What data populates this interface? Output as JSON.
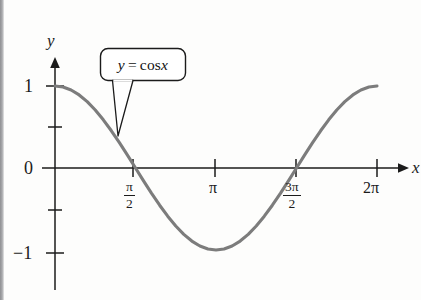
{
  "figure": {
    "kind": "math-function-graph",
    "background_color": "#fdfdfc",
    "curve_color": "#7c7c7c",
    "axis_color": "#1b1b1b",
    "annotation_label": {
      "y_var": "y",
      "equals": "=",
      "expression": "cos",
      "argument": "x",
      "full_text": "y = cos x"
    },
    "axes": {
      "x_axis_label": "x",
      "y_axis_label": "y"
    },
    "origin_label": "0"
  },
  "chart_data": {
    "type": "line",
    "title": "",
    "subtitle": "",
    "xlabel": "x",
    "ylabel": "y",
    "grid": false,
    "legend": null,
    "annotations": [
      {
        "text": "y = cos x",
        "style": "rounded-callout-box",
        "points_to_x": 0.78,
        "points_to_y": 0.71
      }
    ],
    "xlim": [
      0,
      6.7858
    ],
    "ylim": [
      -1.35,
      1.35
    ],
    "xticks": [
      1.5708,
      3.1416,
      4.7124,
      6.2832
    ],
    "xticklabels": [
      "π/2",
      "π",
      "3π/2",
      "2π"
    ],
    "yticks": [
      -1,
      -0.5,
      0,
      0.5,
      1
    ],
    "yticklabels": [
      "-1",
      "",
      "0",
      "",
      "1"
    ],
    "series": [
      {
        "name": "y = cos x",
        "color": "#7c7c7c",
        "x": [
          0,
          0.1571,
          0.3142,
          0.4712,
          0.6283,
          0.7854,
          0.9425,
          1.0996,
          1.2566,
          1.4137,
          1.5708,
          1.7279,
          1.885,
          2.042,
          2.1991,
          2.3562,
          2.5133,
          2.6704,
          2.8274,
          2.9845,
          3.1416,
          3.2987,
          3.4558,
          3.6128,
          3.7699,
          3.927,
          4.0841,
          4.2412,
          4.3982,
          4.5553,
          4.7124,
          4.8695,
          5.0265,
          5.1836,
          5.3407,
          5.4978,
          5.6549,
          5.8119,
          5.969,
          6.1261,
          6.2832
        ],
        "y": [
          1,
          0.9877,
          0.9511,
          0.891,
          0.809,
          0.7071,
          0.5878,
          0.454,
          0.309,
          0.1564,
          0,
          -0.1564,
          -0.309,
          -0.454,
          -0.5878,
          -0.7071,
          -0.809,
          -0.891,
          -0.9511,
          -0.9877,
          -1,
          -0.9877,
          -0.9511,
          -0.891,
          -0.809,
          -0.7071,
          -0.5878,
          -0.454,
          -0.309,
          -0.1564,
          0,
          0.1564,
          0.309,
          0.454,
          0.5878,
          0.7071,
          0.809,
          0.891,
          0.9511,
          0.9877,
          1
        ]
      }
    ]
  },
  "labels": {
    "y_axis_name": "y",
    "x_axis_name": "x",
    "y_one": "1",
    "y_zero": "0",
    "y_minus_one": "−1",
    "x_half_pi_num": "π",
    "x_half_pi_den": "2",
    "x_pi": "π",
    "x_three_half_pi_num": "3π",
    "x_three_half_pi_den": "2",
    "x_two_pi": "2π"
  }
}
